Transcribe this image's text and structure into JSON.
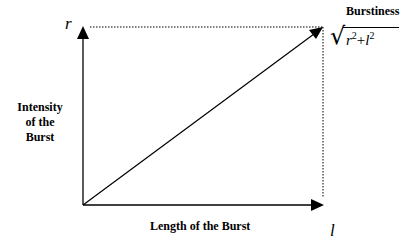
{
  "diagram": {
    "axes": {
      "y_axis_symbol": "r",
      "x_axis_symbol": "l",
      "y_axis_label_lines": [
        "Intensity",
        "of the",
        "Burst"
      ],
      "x_axis_label": "Length of the Burst"
    },
    "result_vector": {
      "label": "Burstiness",
      "formula_base_1": "r",
      "formula_exp_1": "2",
      "formula_op": "+",
      "formula_base_2": "l",
      "formula_exp_2": "2"
    },
    "colors": {
      "line": "#000000",
      "background": "#ffffff"
    }
  }
}
